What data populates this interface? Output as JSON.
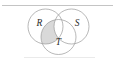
{
  "figure": {
    "kind": "venn-diagram",
    "background_color": "#ffffff",
    "outline_color": "#9a9a9a",
    "label_color": "#2b2b2b",
    "shade_color": "#d2d2d2",
    "rule_color": "#b5b5b5",
    "rule_color_bottom": "#dcdcdc"
  },
  "rules": {
    "top": {
      "x1": 2,
      "y1": 5.5,
      "x2": 113,
      "y2": 5.5
    },
    "bottom": {
      "x1": 24,
      "y1": 57.5,
      "x2": 95,
      "y2": 57.5
    }
  },
  "sets": [
    {
      "id": "R",
      "label": "R",
      "role": "top-left-circle",
      "cx": 45.5,
      "cy": 26.5,
      "r": 17.5,
      "label_x": 39.5,
      "label_y": 24.0
    },
    {
      "id": "S",
      "label": "S",
      "role": "top-right-circle",
      "cx": 71.5,
      "cy": 26.5,
      "r": 17.5,
      "label_x": 77.0,
      "label_y": 24.0
    },
    {
      "id": "T",
      "label": "T",
      "role": "bottom-center-circle",
      "cx": 58.5,
      "cy": 37.0,
      "r": 17.5,
      "label_x": 58.5,
      "label_y": 43.0
    }
  ],
  "shaded_region": {
    "id": "R-and-T-only",
    "description": "lens where circle R overlaps circle T, outside circle S",
    "fill": "#d2d2d2",
    "opacity": 0.85
  }
}
